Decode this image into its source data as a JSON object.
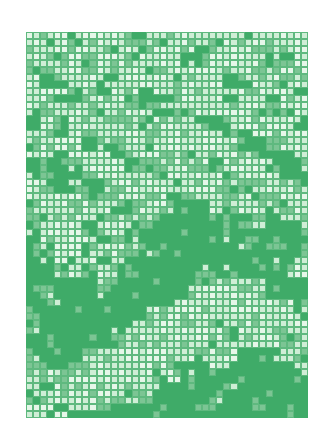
{
  "artwork": {
    "description": "Green mosaic grid pattern artwork",
    "columns": 40,
    "rows": 55,
    "colors": {
      "dark": "#3fab68",
      "mid": "#7cc594",
      "light": "#cfeed6",
      "lightest": "#e6f7e9",
      "grid_line": "#5fb97f",
      "background": "#ffffff"
    },
    "density_map": [
      "21212221112221212222",
      "12222112122211221212",
      "22121221222112222112",
      "11221222112222121222",
      "20122112221222112212",
      "12211022122211222221",
      "22112221011222122122",
      "11222122201122221112",
      "02122211122210122221",
      "21021222212221102222",
      "12220112122222210122",
      "22122201222122221012",
      "01112220122221222101",
      "10001222212222122210",
      "21110122221222112221",
      "22221122120122221122",
      "12212211221002122112",
      "21122122110001111011",
      "12221221100000111001",
      "02222111000000101000",
      "01221221100000010001",
      "01212110010000001102",
      "00121211000011100012",
      "00010110000012221000",
      "01000100000122222100",
      "00100000011222222220",
      "10000000122221222221",
      "00000001222211222222",
      "10000012222222122212",
      "01000112222221122211",
      "10001222222212200121",
      "11012222221102100012",
      "12122222212100000001",
      "21222222210000100000",
      "12222211100001000000",
      "22122110000010000010",
      "21211000000000000000"
    ]
  }
}
